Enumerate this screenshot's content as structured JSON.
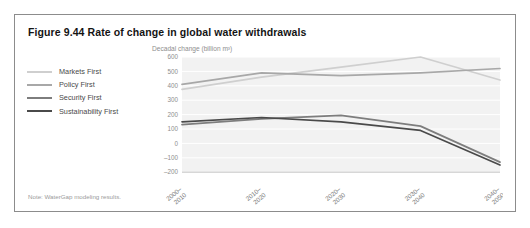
{
  "figure": {
    "title": "Figure 9.44 Rate of change in global water withdrawals",
    "note": "Note: WaterGap modeling results."
  },
  "legend": {
    "position": "left",
    "items": [
      {
        "label": "Markets First",
        "color": "#cfcfcf"
      },
      {
        "label": "Policy First",
        "color": "#a8a8a8"
      },
      {
        "label": "Security First",
        "color": "#7d7d7d"
      },
      {
        "label": "Sustainability First",
        "color": "#4a4a4a"
      }
    ]
  },
  "chart_data": {
    "type": "line",
    "title": "Rate of change in global water withdrawals",
    "ylabel": "Decadal change (billion m³)",
    "xlabel": "",
    "categories": [
      "2000–2010",
      "2010–2020",
      "2020–2030",
      "2030–2040",
      "2040–2050"
    ],
    "ylim": [
      -200,
      600
    ],
    "yticks": [
      600,
      500,
      400,
      300,
      200,
      100,
      0,
      -100,
      -200
    ],
    "ytick_labels": [
      "600",
      "500",
      "400",
      "300",
      "200",
      "100",
      "0",
      "–100",
      "–200"
    ],
    "grid": true,
    "legend_position": "left-outside",
    "series": [
      {
        "name": "Markets First",
        "color": "#cfcfcf",
        "values": [
          375,
          460,
          530,
          600,
          440
        ]
      },
      {
        "name": "Policy First",
        "color": "#a8a8a8",
        "values": [
          410,
          490,
          470,
          490,
          520
        ]
      },
      {
        "name": "Security First",
        "color": "#7d7d7d",
        "values": [
          130,
          170,
          195,
          120,
          -130
        ]
      },
      {
        "name": "Sustainability First",
        "color": "#4a4a4a",
        "values": [
          150,
          180,
          150,
          90,
          -150
        ]
      }
    ]
  }
}
